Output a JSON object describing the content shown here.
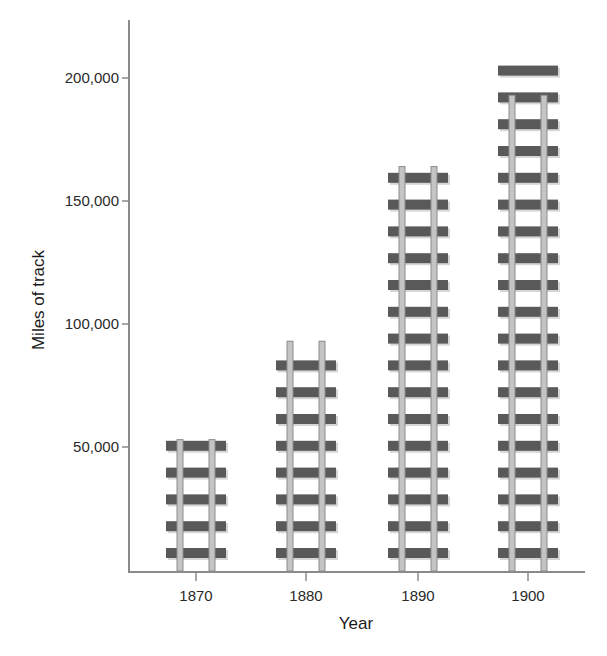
{
  "chart_data": {
    "type": "bar",
    "style": "pictograph-railroad-tracks",
    "title": "",
    "xlabel": "Year",
    "ylabel": "Miles of track",
    "categories": [
      "1870",
      "1880",
      "1890",
      "1900"
    ],
    "values": [
      53000,
      93000,
      164000,
      193000
    ],
    "series": [
      {
        "name": "Miles of track",
        "values": [
          53000,
          93000,
          164000,
          193000
        ]
      }
    ],
    "tie_counts": [
      5,
      8,
      15,
      19
    ],
    "ylim": [
      0,
      210000
    ],
    "yticks": [
      50000,
      100000,
      150000,
      200000
    ],
    "ytick_labels": [
      "50,000",
      "100,000",
      "150,000",
      "200,000"
    ],
    "grid": false,
    "legend": "none"
  },
  "colors": {
    "axis": "#8a8a8a",
    "tie": "#595959",
    "rail": "#c4c4c4",
    "rail_edge": "#8c8c8c",
    "text": "#2a2a2a"
  }
}
